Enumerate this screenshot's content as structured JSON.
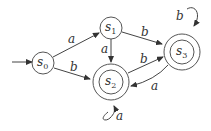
{
  "diagram": {
    "type": "finite-state-automaton",
    "start_state": "s0",
    "states": [
      {
        "id": "s0",
        "label": "s",
        "sub": "0",
        "accepting": false
      },
      {
        "id": "s1",
        "label": "s",
        "sub": "1",
        "accepting": false
      },
      {
        "id": "s2",
        "label": "s",
        "sub": "2",
        "accepting": true
      },
      {
        "id": "s3",
        "label": "s",
        "sub": "3",
        "accepting": true
      }
    ],
    "transitions": [
      {
        "from": "s0",
        "to": "s1",
        "label": "a"
      },
      {
        "from": "s0",
        "to": "s2",
        "label": "b"
      },
      {
        "from": "s1",
        "to": "s2",
        "label": "a"
      },
      {
        "from": "s1",
        "to": "s3",
        "label": "b"
      },
      {
        "from": "s2",
        "to": "s3",
        "label": "b"
      },
      {
        "from": "s3",
        "to": "s2",
        "label": "a"
      },
      {
        "from": "s2",
        "to": "s2",
        "label": "a"
      },
      {
        "from": "s3",
        "to": "s3",
        "label": "b"
      }
    ]
  }
}
